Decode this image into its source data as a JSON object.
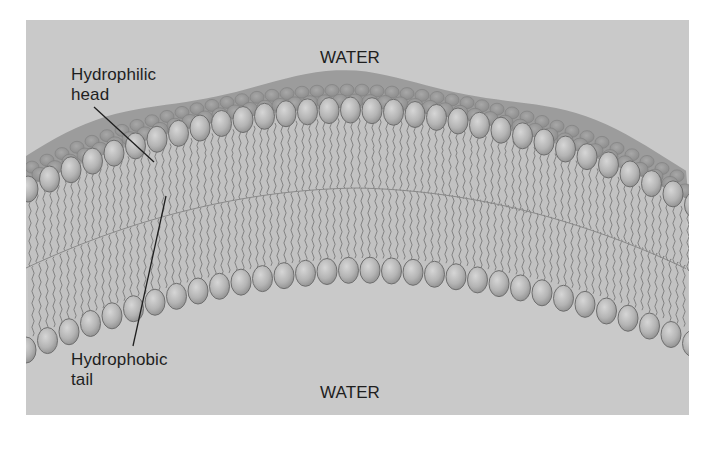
{
  "figure": {
    "labels": {
      "water_top": "WATER",
      "water_bottom": "WATER",
      "head_line1": "Hydrophilic",
      "head_line2": "head",
      "tail_line1": "Hydrophobic",
      "tail_line2": "tail"
    },
    "colors": {
      "page_background": "#ffffff",
      "water": "#c9c9c9",
      "top_band": "#9c9c9c",
      "head_fill": "#b4b4b4",
      "head_outline": "#6e6e6e",
      "tail_stroke": "#7a7a7a",
      "text": "#1e1e1e",
      "leader_line": "#1e1e1e"
    },
    "structure": {
      "layers": [
        "outer leaflet heads",
        "hydrophobic tails",
        "inner leaflet heads"
      ],
      "curvature": "arched upward, peak near center"
    }
  }
}
